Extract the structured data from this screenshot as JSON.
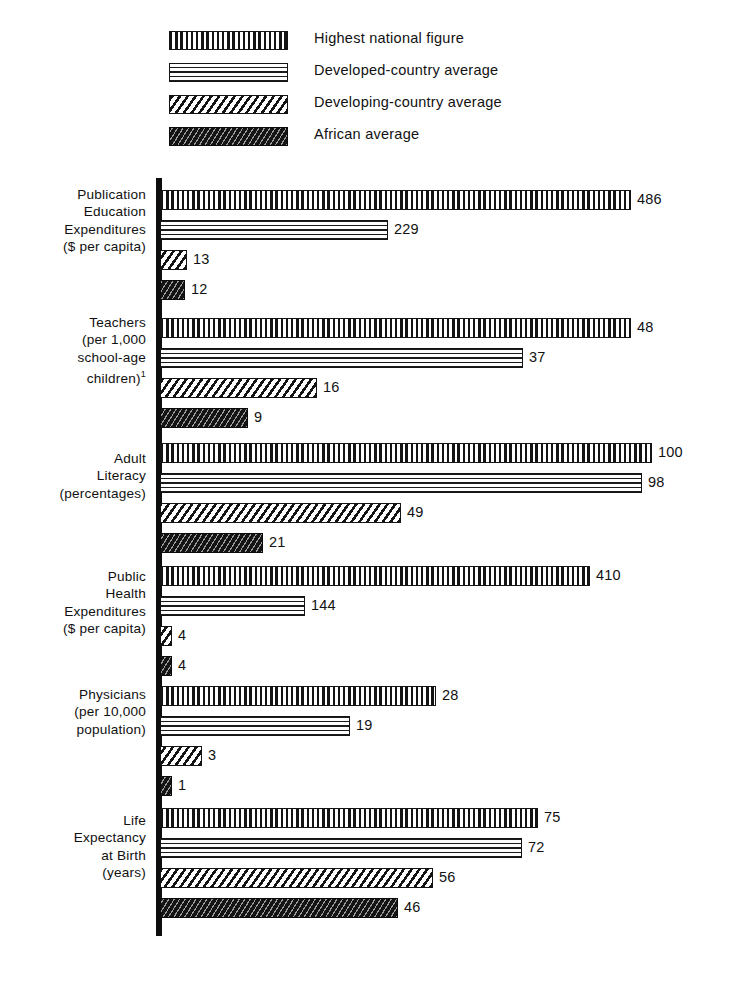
{
  "legend": {
    "items": [
      {
        "label": "Highest national figure",
        "pattern": "vertical",
        "name": "legend-highest-national-figure"
      },
      {
        "label": "Developed-country average",
        "pattern": "horizontal",
        "name": "legend-developed-country-average"
      },
      {
        "label": "Developing-country average",
        "pattern": "diagonal",
        "name": "legend-developing-country-average"
      },
      {
        "label": "African average",
        "pattern": "dark",
        "name": "legend-african-average"
      }
    ]
  },
  "chart_data": {
    "type": "bar",
    "orientation": "horizontal",
    "title": "",
    "xlabel": "",
    "ylabel": "",
    "grid": false,
    "legend_position": "top",
    "series": [
      {
        "name": "Highest national figure",
        "pattern": "vertical",
        "values": [
          486,
          48,
          100,
          410,
          28,
          75
        ]
      },
      {
        "name": "Developed-country average",
        "pattern": "horizontal",
        "values": [
          229,
          37,
          98,
          144,
          19,
          72
        ]
      },
      {
        "name": "Developing-country average",
        "pattern": "diagonal",
        "values": [
          13,
          16,
          49,
          4,
          3,
          56
        ]
      },
      {
        "name": "African average",
        "pattern": "dark",
        "values": [
          12,
          9,
          21,
          4,
          1,
          46
        ]
      }
    ],
    "categories": [
      "Publication Education Expenditures ($ per capita)",
      "Teachers (per 1,000 school-age children)",
      "Adult Literacy (percentages)",
      "Public Health Expenditures ($ per capita)",
      "Physicians (per 10,000 population)",
      "Life Expectancy at Birth (years)"
    ],
    "groups": [
      {
        "id": "education-expenditures",
        "label_lines": [
          "Publication",
          "Education",
          "Expenditures",
          "($ per capita)"
        ],
        "footnote_marker": "",
        "bars": [
          {
            "series": "Highest national figure",
            "pattern": "vertical",
            "value": 486,
            "value_text": "486",
            "px": 471
          },
          {
            "series": "Developed-country average",
            "pattern": "horizontal",
            "value": 229,
            "value_text": "229",
            "px": 228
          },
          {
            "series": "Developing-country average",
            "pattern": "diagonal",
            "value": 13,
            "value_text": "13",
            "px": 27
          },
          {
            "series": "African average",
            "pattern": "dark",
            "value": 12,
            "value_text": "12",
            "px": 25
          }
        ]
      },
      {
        "id": "teachers",
        "label_lines": [
          "Teachers",
          "(per 1,000",
          "school-age",
          "children)"
        ],
        "footnote_marker": "1",
        "bars": [
          {
            "series": "Highest national figure",
            "pattern": "vertical",
            "value": 48,
            "value_text": "48",
            "px": 471
          },
          {
            "series": "Developed-country average",
            "pattern": "horizontal",
            "value": 37,
            "value_text": "37",
            "px": 363
          },
          {
            "series": "Developing-country average",
            "pattern": "diagonal",
            "value": 16,
            "value_text": "16",
            "px": 157
          },
          {
            "series": "African average",
            "pattern": "dark",
            "value": 9,
            "value_text": "9",
            "px": 88
          }
        ]
      },
      {
        "id": "adult-literacy",
        "label_lines": [
          "Adult",
          "Literacy",
          "(percentages)"
        ],
        "footnote_marker": "",
        "bars": [
          {
            "series": "Highest national figure",
            "pattern": "vertical",
            "value": 100,
            "value_text": "100",
            "px": 492
          },
          {
            "series": "Developed-country average",
            "pattern": "horizontal",
            "value": 98,
            "value_text": "98",
            "px": 482
          },
          {
            "series": "Developing-country average",
            "pattern": "diagonal",
            "value": 49,
            "value_text": "49",
            "px": 241
          },
          {
            "series": "African average",
            "pattern": "dark",
            "value": 21,
            "value_text": "21",
            "px": 103
          }
        ]
      },
      {
        "id": "public-health-expenditures",
        "label_lines": [
          "Public",
          "Health",
          "Expenditures",
          "($ per capita)"
        ],
        "footnote_marker": "",
        "bars": [
          {
            "series": "Highest national figure",
            "pattern": "vertical",
            "value": 410,
            "value_text": "410",
            "px": 430
          },
          {
            "series": "Developed-country average",
            "pattern": "horizontal",
            "value": 144,
            "value_text": "144",
            "px": 145
          },
          {
            "series": "Developing-country average",
            "pattern": "diagonal",
            "value": 4,
            "value_text": "4",
            "px": 12
          },
          {
            "series": "African average",
            "pattern": "dark",
            "value": 4,
            "value_text": "4",
            "px": 12
          }
        ]
      },
      {
        "id": "physicians",
        "label_lines": [
          "Physicians",
          "(per 10,000",
          "population)"
        ],
        "footnote_marker": "",
        "bars": [
          {
            "series": "Highest national figure",
            "pattern": "vertical",
            "value": 28,
            "value_text": "28",
            "px": 276
          },
          {
            "series": "Developed-country average",
            "pattern": "horizontal",
            "value": 19,
            "value_text": "19",
            "px": 190
          },
          {
            "series": "Developing-country average",
            "pattern": "diagonal",
            "value": 3,
            "value_text": "3",
            "px": 42
          },
          {
            "series": "African average",
            "pattern": "dark",
            "value": 1,
            "value_text": "1",
            "px": 12
          }
        ]
      },
      {
        "id": "life-expectancy",
        "label_lines": [
          "Life",
          "Expectancy",
          "at Birth",
          "(years)"
        ],
        "footnote_marker": "",
        "bars": [
          {
            "series": "Highest national figure",
            "pattern": "vertical",
            "value": 75,
            "value_text": "75",
            "px": 378
          },
          {
            "series": "Developed-country average",
            "pattern": "horizontal",
            "value": 72,
            "value_text": "72",
            "px": 362
          },
          {
            "series": "Developing-country average",
            "pattern": "diagonal",
            "value": 56,
            "value_text": "56",
            "px": 273
          },
          {
            "series": "African average",
            "pattern": "dark",
            "value": 46,
            "value_text": "46",
            "px": 238
          }
        ]
      }
    ]
  }
}
